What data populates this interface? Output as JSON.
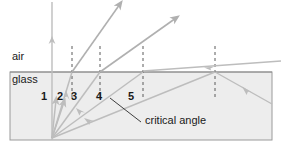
{
  "figure": {
    "type": "optics-refraction-critical-angle-diagram",
    "width": 283,
    "height": 146,
    "background_color": "#ffffff"
  },
  "media": {
    "upper": {
      "name": "air",
      "label": "air",
      "label_x": 12,
      "label_y": 57,
      "fill": "#ffffff"
    },
    "lower": {
      "name": "glass",
      "label": "glass",
      "label_x": 12,
      "label_y": 76,
      "fill": "#eeeeee"
    }
  },
  "glass_block": {
    "x": 10,
    "y": 72,
    "width": 262,
    "height": 68,
    "fill": "#ededed",
    "stroke": "#9a9a9a"
  },
  "interface": {
    "y": 72,
    "x_start": 10,
    "x_end": 272,
    "stroke": "#8c8c8c"
  },
  "source_point": {
    "x": 52,
    "y": 138
  },
  "normal_line": {
    "name": "normal",
    "x": 52,
    "y_top": 2,
    "y_bottom": 140,
    "arrow_y": 38,
    "stroke": "#b9b9b9"
  },
  "colors": {
    "ray_stroke": "#bdbdbd",
    "ray_stroke_strong": "#b0b0b0",
    "dashed_normal": "#5a5a5a",
    "text": "#1a1a1a",
    "box_stroke": "#9a9a9a"
  },
  "rays": [
    {
      "id": 1,
      "label": "1",
      "label_x": 41,
      "label_y": 95,
      "incidence_hit_x": 56,
      "description": "near-normal incidence, refracts with small bend",
      "incident": {
        "x1": 52,
        "y1": 138,
        "x2": 56,
        "y2": 100
      },
      "arrow_at": {
        "x": 56,
        "y": 102
      }
    },
    {
      "id": 2,
      "label": "2",
      "label_x": 57,
      "label_y": 95,
      "incidence_hit_x": 65,
      "description": "small angle of incidence",
      "incident": {
        "x1": 52,
        "y1": 138,
        "x2": 64,
        "y2": 101
      },
      "arrow_at": {
        "x": 63,
        "y": 104
      }
    },
    {
      "id": 3,
      "label": "3",
      "label_x": 71,
      "label_y": 95,
      "incidence_hit_x": 72,
      "description": "refracts steeply into air",
      "incident": {
        "x1": 52,
        "y1": 138,
        "x2": 72,
        "y2": 72
      },
      "refracted": {
        "x1": 72,
        "y1": 72,
        "x2": 120,
        "y2": 4
      },
      "normal_x": 72
    },
    {
      "id": 4,
      "label": "4",
      "label_x": 96,
      "label_y": 95,
      "incidence_hit_x": 100,
      "description": "larger angle, refracted ray bends farther from normal",
      "incident": {
        "x1": 52,
        "y1": 138,
        "x2": 100,
        "y2": 72
      },
      "refracted": {
        "x1": 100,
        "y1": 72,
        "x2": 175,
        "y2": 18
      },
      "normal_x": 100
    },
    {
      "id": 5,
      "label": "5",
      "label_x": 128,
      "label_y": 95,
      "incidence_hit_x": 143,
      "description": "at the critical angle the refracted ray grazes along the surface at 90 degrees",
      "incident": {
        "x1": 52,
        "y1": 138,
        "x2": 143,
        "y2": 72
      },
      "refracted": {
        "x1": 143,
        "y1": 72,
        "x2": 280,
        "y2": 63
      },
      "normal_x": 143
    }
  ],
  "total_internal_reflection": {
    "name": "total-internal-reflection",
    "hit_x": 215,
    "hit_y": 72,
    "incident": {
      "x1": 52,
      "y1": 138,
      "x2": 215,
      "y2": 72
    },
    "reflected": {
      "x1": 215,
      "y1": 72,
      "x2": 272,
      "y2": 104
    },
    "normal_x": 215,
    "description": "beyond the critical angle the ray is totally internally reflected back into the glass"
  },
  "grazing_exit_ray": {
    "name": "grazing-exit-ray",
    "x1": 143,
    "y1": 70,
    "x2": 281,
    "y2": 60
  },
  "annotation": {
    "name": "critical-angle-annotation",
    "label": "critical angle",
    "label_x": 146,
    "label_y": 120,
    "leader": {
      "x1": 110,
      "y1": 98,
      "x2": 141,
      "y2": 122
    }
  },
  "dashed_normals": [
    {
      "x": 72,
      "y_top": 46,
      "y_bottom": 100
    },
    {
      "x": 100,
      "y_top": 46,
      "y_bottom": 100
    },
    {
      "x": 143,
      "y_top": 46,
      "y_bottom": 100
    },
    {
      "x": 215,
      "y_top": 46,
      "y_bottom": 100
    }
  ]
}
